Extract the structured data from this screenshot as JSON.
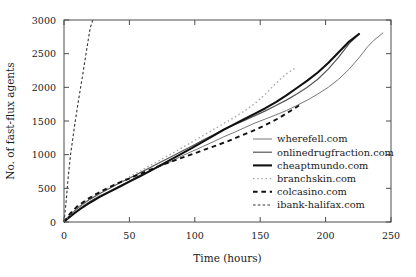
{
  "chart_data": {
    "type": "line",
    "title": "",
    "xlabel": "Time (hours)",
    "ylabel": "No. of fast-flux agents",
    "xlim": [
      0,
      250
    ],
    "ylim": [
      0,
      3000
    ],
    "xticks": [
      0,
      50,
      100,
      150,
      200,
      250
    ],
    "yticks": [
      0,
      500,
      1000,
      1500,
      2000,
      2500,
      3000
    ],
    "grid": false,
    "legend_position": "center-right-inside",
    "series": [
      {
        "name": "wherefell.com",
        "style": "solid",
        "color": "#777777",
        "width": 1.0,
        "x": [
          0,
          3,
          8,
          14,
          20,
          27,
          34,
          42,
          50,
          58,
          66,
          74,
          82,
          90,
          98,
          106,
          114,
          122,
          130,
          138,
          146,
          154,
          162,
          170,
          178,
          186,
          194,
          202,
          210,
          218,
          226,
          232,
          237,
          244
        ],
        "y": [
          0,
          60,
          140,
          230,
          310,
          390,
          450,
          530,
          610,
          690,
          760,
          830,
          900,
          980,
          1050,
          1120,
          1190,
          1265,
          1330,
          1400,
          1470,
          1530,
          1590,
          1655,
          1730,
          1810,
          1900,
          2000,
          2120,
          2270,
          2450,
          2600,
          2700,
          2810
        ]
      },
      {
        "name": "onlinedrugfraction.com",
        "style": "solid",
        "color": "#555555",
        "width": 1.2,
        "x": [
          0,
          3,
          8,
          14,
          20,
          27,
          34,
          42,
          50,
          58,
          66,
          74,
          82,
          90,
          98,
          106,
          114,
          122,
          130,
          138,
          146,
          154,
          162,
          170,
          178,
          186,
          194,
          202,
          210,
          218,
          226
        ],
        "y": [
          0,
          70,
          165,
          260,
          340,
          420,
          490,
          575,
          650,
          730,
          810,
          890,
          970,
          1050,
          1130,
          1215,
          1290,
          1370,
          1440,
          1510,
          1580,
          1650,
          1730,
          1810,
          1900,
          2000,
          2120,
          2270,
          2450,
          2650,
          2800
        ]
      },
      {
        "name": "cheaptmundo.com",
        "style": "solid",
        "color": "#111111",
        "width": 2.1,
        "x": [
          0,
          3,
          8,
          14,
          20,
          27,
          34,
          42,
          50,
          58,
          66,
          74,
          82,
          90,
          98,
          106,
          114,
          122,
          130,
          138,
          146,
          154,
          162,
          170,
          178,
          186,
          194,
          202,
          210,
          218,
          226
        ],
        "y": [
          0,
          55,
          130,
          215,
          290,
          370,
          440,
          520,
          600,
          680,
          760,
          845,
          930,
          1015,
          1100,
          1190,
          1280,
          1370,
          1450,
          1530,
          1610,
          1690,
          1780,
          1880,
          1990,
          2100,
          2220,
          2360,
          2520,
          2680,
          2800
        ]
      },
      {
        "name": "branchskin.com",
        "style": "dotted",
        "color": "#a8a8a8",
        "width": 1.4,
        "x": [
          0,
          3,
          8,
          14,
          20,
          27,
          34,
          42,
          50,
          58,
          66,
          74,
          82,
          90,
          98,
          106,
          114,
          122,
          130,
          138,
          146,
          154,
          162,
          170,
          178
        ],
        "y": [
          0,
          75,
          175,
          275,
          355,
          435,
          505,
          590,
          670,
          755,
          840,
          925,
          1010,
          1100,
          1190,
          1280,
          1370,
          1460,
          1550,
          1650,
          1760,
          1900,
          2060,
          2200,
          2300
        ]
      },
      {
        "name": "colcasino.com",
        "style": "dashed",
        "color": "#111111",
        "width": 1.9,
        "x": [
          0,
          4,
          10,
          18,
          26,
          34,
          44,
          54,
          64,
          74,
          84,
          94,
          104,
          114,
          124,
          134,
          144,
          154,
          164,
          174,
          182
        ],
        "y": [
          0,
          110,
          230,
          340,
          430,
          510,
          600,
          680,
          760,
          840,
          910,
          980,
          1050,
          1120,
          1190,
          1270,
          1350,
          1440,
          1540,
          1660,
          1760
        ]
      },
      {
        "name": "ibank-halifax.com",
        "style": "dashed",
        "color": "#333333",
        "width": 1.1,
        "x": [
          0,
          1.5,
          3,
          5,
          8,
          11,
          14,
          17,
          20,
          22
        ],
        "y": [
          0,
          280,
          620,
          1000,
          1420,
          1800,
          2150,
          2520,
          2880,
          3000
        ]
      }
    ]
  }
}
